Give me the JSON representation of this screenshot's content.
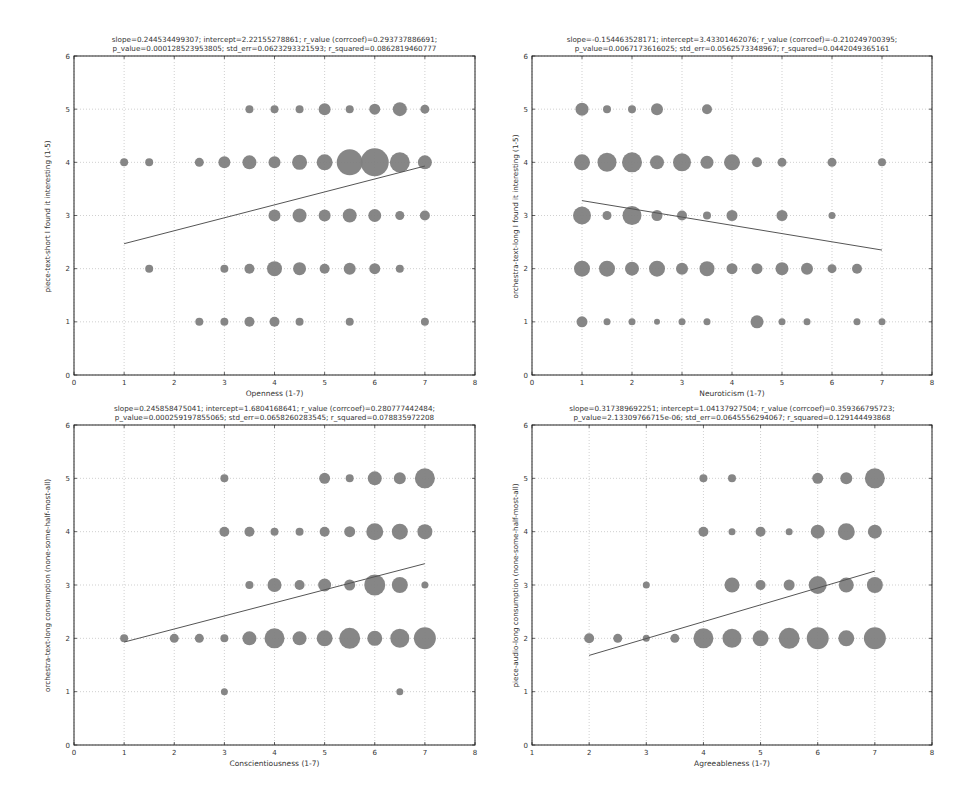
{
  "figure": {
    "background": "#ffffff",
    "marker_color": "#7f7f7f",
    "line_color": "#555555",
    "grid_color": "#b0b0b0"
  },
  "chart_data": [
    {
      "type": "scatter",
      "title_line1": "slope=0.244534499307; intercept=2.22155278861; r_value (corrcoef)=0.293737886691;",
      "title_line2": "p_value=0.000128523953805; std_err=0.0623293321593; r_squared=0.0862819460777",
      "xlabel": "Openness (1-7)",
      "ylabel": "piece-text-short I found it interesting (1-5)",
      "xlim": [
        0,
        8
      ],
      "ylim": [
        0,
        6
      ],
      "xticks": [
        0,
        1,
        2,
        3,
        4,
        5,
        6,
        7,
        8
      ],
      "yticks": [
        0,
        1,
        2,
        3,
        4,
        5,
        6
      ],
      "grid": true,
      "fit_line": {
        "x": [
          1,
          7
        ],
        "y": [
          2.47,
          3.93
        ]
      },
      "points": [
        {
          "x": 3.5,
          "y": 5,
          "r": 4
        },
        {
          "x": 4,
          "y": 5,
          "r": 4
        },
        {
          "x": 4.5,
          "y": 5,
          "r": 4
        },
        {
          "x": 5,
          "y": 5,
          "r": 6
        },
        {
          "x": 5.5,
          "y": 5,
          "r": 4
        },
        {
          "x": 6,
          "y": 5,
          "r": 5.5
        },
        {
          "x": 6.5,
          "y": 5,
          "r": 7
        },
        {
          "x": 7,
          "y": 5,
          "r": 4.5
        },
        {
          "x": 1,
          "y": 4,
          "r": 4
        },
        {
          "x": 1.5,
          "y": 4,
          "r": 4
        },
        {
          "x": 2.5,
          "y": 4,
          "r": 4.5
        },
        {
          "x": 3,
          "y": 4,
          "r": 6
        },
        {
          "x": 3.5,
          "y": 4,
          "r": 7
        },
        {
          "x": 4,
          "y": 4,
          "r": 6
        },
        {
          "x": 4.5,
          "y": 4,
          "r": 7.5
        },
        {
          "x": 5,
          "y": 4,
          "r": 8
        },
        {
          "x": 5.5,
          "y": 4,
          "r": 13
        },
        {
          "x": 6,
          "y": 4,
          "r": 14
        },
        {
          "x": 6.5,
          "y": 4,
          "r": 10
        },
        {
          "x": 7,
          "y": 4,
          "r": 7
        },
        {
          "x": 4,
          "y": 3,
          "r": 6
        },
        {
          "x": 4.5,
          "y": 3,
          "r": 7
        },
        {
          "x": 5,
          "y": 3,
          "r": 6
        },
        {
          "x": 5.5,
          "y": 3,
          "r": 7
        },
        {
          "x": 6,
          "y": 3,
          "r": 6.5
        },
        {
          "x": 6.5,
          "y": 3,
          "r": 4.5
        },
        {
          "x": 7,
          "y": 3,
          "r": 5
        },
        {
          "x": 1.5,
          "y": 2,
          "r": 4
        },
        {
          "x": 3,
          "y": 2,
          "r": 4
        },
        {
          "x": 3.5,
          "y": 2,
          "r": 5
        },
        {
          "x": 4,
          "y": 2,
          "r": 7.5
        },
        {
          "x": 4.5,
          "y": 2,
          "r": 6.5
        },
        {
          "x": 5,
          "y": 2,
          "r": 5
        },
        {
          "x": 5.5,
          "y": 2,
          "r": 6
        },
        {
          "x": 6,
          "y": 2,
          "r": 5.5
        },
        {
          "x": 6.5,
          "y": 2,
          "r": 4
        },
        {
          "x": 2.5,
          "y": 1,
          "r": 4
        },
        {
          "x": 3,
          "y": 1,
          "r": 4
        },
        {
          "x": 3.5,
          "y": 1,
          "r": 5
        },
        {
          "x": 4,
          "y": 1,
          "r": 5
        },
        {
          "x": 4.5,
          "y": 1,
          "r": 4
        },
        {
          "x": 5.5,
          "y": 1,
          "r": 4
        },
        {
          "x": 7,
          "y": 1,
          "r": 4
        }
      ]
    },
    {
      "type": "scatter",
      "title_line1": "slope=-0.154463528171; intercept=3.43301462076; r_value (corrcoef)=-0.210249700395;",
      "title_line2": "p_value=0.0067173616025; std_err=0.0562573348967; r_squared=0.0442049365161",
      "xlabel": "Neuroticism (1-7)",
      "ylabel": "orchestra-text-long I found it interesting (1-5)",
      "xlim": [
        0,
        8
      ],
      "ylim": [
        0,
        6
      ],
      "xticks": [
        0,
        1,
        2,
        3,
        4,
        5,
        6,
        7,
        8
      ],
      "yticks": [
        0,
        1,
        2,
        3,
        4,
        5,
        6
      ],
      "grid": true,
      "fit_line": {
        "x": [
          1,
          7
        ],
        "y": [
          3.28,
          2.35
        ]
      },
      "points": [
        {
          "x": 1,
          "y": 5,
          "r": 6.5
        },
        {
          "x": 1.5,
          "y": 5,
          "r": 4
        },
        {
          "x": 2,
          "y": 5,
          "r": 4
        },
        {
          "x": 2.5,
          "y": 5,
          "r": 6
        },
        {
          "x": 3.5,
          "y": 5,
          "r": 5
        },
        {
          "x": 1,
          "y": 4,
          "r": 8
        },
        {
          "x": 1.5,
          "y": 4,
          "r": 9.5
        },
        {
          "x": 2,
          "y": 4,
          "r": 10
        },
        {
          "x": 2.5,
          "y": 4,
          "r": 7
        },
        {
          "x": 3,
          "y": 4,
          "r": 9
        },
        {
          "x": 3.5,
          "y": 4,
          "r": 6.5
        },
        {
          "x": 4,
          "y": 4,
          "r": 8
        },
        {
          "x": 4.5,
          "y": 4,
          "r": 5
        },
        {
          "x": 5,
          "y": 4,
          "r": 4.5
        },
        {
          "x": 6,
          "y": 4,
          "r": 4.5
        },
        {
          "x": 7,
          "y": 4,
          "r": 4
        },
        {
          "x": 1,
          "y": 3,
          "r": 9
        },
        {
          "x": 1.5,
          "y": 3,
          "r": 4.5
        },
        {
          "x": 2,
          "y": 3,
          "r": 9.5
        },
        {
          "x": 2.5,
          "y": 3,
          "r": 5.5
        },
        {
          "x": 3,
          "y": 3,
          "r": 5
        },
        {
          "x": 3.5,
          "y": 3,
          "r": 4
        },
        {
          "x": 4,
          "y": 3,
          "r": 5.5
        },
        {
          "x": 5,
          "y": 3,
          "r": 5.5
        },
        {
          "x": 6,
          "y": 3,
          "r": 3.5
        },
        {
          "x": 1,
          "y": 2,
          "r": 8
        },
        {
          "x": 1.5,
          "y": 2,
          "r": 8
        },
        {
          "x": 2,
          "y": 2,
          "r": 7
        },
        {
          "x": 2.5,
          "y": 2,
          "r": 8
        },
        {
          "x": 3,
          "y": 2,
          "r": 6
        },
        {
          "x": 3.5,
          "y": 2,
          "r": 7.5
        },
        {
          "x": 4,
          "y": 2,
          "r": 5.5
        },
        {
          "x": 4.5,
          "y": 2,
          "r": 5.5
        },
        {
          "x": 5,
          "y": 2,
          "r": 6.5
        },
        {
          "x": 5.5,
          "y": 2,
          "r": 6
        },
        {
          "x": 6,
          "y": 2,
          "r": 4.5
        },
        {
          "x": 6.5,
          "y": 2,
          "r": 5
        },
        {
          "x": 1,
          "y": 1,
          "r": 5.5
        },
        {
          "x": 1.5,
          "y": 1,
          "r": 3.5
        },
        {
          "x": 2,
          "y": 1,
          "r": 3.5
        },
        {
          "x": 2.5,
          "y": 1,
          "r": 3
        },
        {
          "x": 3,
          "y": 1,
          "r": 3.5
        },
        {
          "x": 3.5,
          "y": 1,
          "r": 3.5
        },
        {
          "x": 4.5,
          "y": 1,
          "r": 6.5
        },
        {
          "x": 5,
          "y": 1,
          "r": 3.5
        },
        {
          "x": 5.5,
          "y": 1,
          "r": 3.5
        },
        {
          "x": 6.5,
          "y": 1,
          "r": 3.5
        },
        {
          "x": 7,
          "y": 1,
          "r": 3.5
        }
      ]
    },
    {
      "type": "scatter",
      "title_line1": "slope=0.245858475041; intercept=1.6804168641; r_value (corrcoef)=0.280777442484;",
      "title_line2": "p_value=0.000259197855065; std_err=0.0658260283545; r_squared=0.078835972208",
      "xlabel": "Conscientiousness (1-7)",
      "ylabel": "orchestra-text-long consumption (none-some-half-most-all)",
      "xlim": [
        0,
        8
      ],
      "ylim": [
        0,
        6
      ],
      "xticks": [
        0,
        1,
        2,
        3,
        4,
        5,
        6,
        7,
        8
      ],
      "yticks": [
        0,
        1,
        2,
        3,
        4,
        5,
        6
      ],
      "grid": true,
      "fit_line": {
        "x": [
          1,
          7
        ],
        "y": [
          1.93,
          3.4
        ]
      },
      "points": [
        {
          "x": 3,
          "y": 5,
          "r": 4
        },
        {
          "x": 5,
          "y": 5,
          "r": 5.5
        },
        {
          "x": 5.5,
          "y": 5,
          "r": 4
        },
        {
          "x": 6,
          "y": 5,
          "r": 7
        },
        {
          "x": 6.5,
          "y": 5,
          "r": 6
        },
        {
          "x": 7,
          "y": 5,
          "r": 10
        },
        {
          "x": 3,
          "y": 4,
          "r": 5
        },
        {
          "x": 3.5,
          "y": 4,
          "r": 5
        },
        {
          "x": 4,
          "y": 4,
          "r": 4
        },
        {
          "x": 4.5,
          "y": 4,
          "r": 4
        },
        {
          "x": 5,
          "y": 4,
          "r": 5
        },
        {
          "x": 5.5,
          "y": 4,
          "r": 5.5
        },
        {
          "x": 6,
          "y": 4,
          "r": 8.5
        },
        {
          "x": 6.5,
          "y": 4,
          "r": 8
        },
        {
          "x": 7,
          "y": 4,
          "r": 7.5
        },
        {
          "x": 3.5,
          "y": 3,
          "r": 4
        },
        {
          "x": 4,
          "y": 3,
          "r": 7
        },
        {
          "x": 4.5,
          "y": 3,
          "r": 5
        },
        {
          "x": 5,
          "y": 3,
          "r": 6.5
        },
        {
          "x": 5.5,
          "y": 3,
          "r": 5.5
        },
        {
          "x": 6,
          "y": 3,
          "r": 10.5
        },
        {
          "x": 6.5,
          "y": 3,
          "r": 8
        },
        {
          "x": 7,
          "y": 3,
          "r": 3.5
        },
        {
          "x": 1,
          "y": 2,
          "r": 4
        },
        {
          "x": 2,
          "y": 2,
          "r": 4.5
        },
        {
          "x": 2.5,
          "y": 2,
          "r": 4.5
        },
        {
          "x": 3,
          "y": 2,
          "r": 4
        },
        {
          "x": 3.5,
          "y": 2,
          "r": 7
        },
        {
          "x": 4,
          "y": 2,
          "r": 10
        },
        {
          "x": 4.5,
          "y": 2,
          "r": 7
        },
        {
          "x": 5,
          "y": 2,
          "r": 8
        },
        {
          "x": 5.5,
          "y": 2,
          "r": 10.5
        },
        {
          "x": 6,
          "y": 2,
          "r": 7.5
        },
        {
          "x": 6.5,
          "y": 2,
          "r": 9.5
        },
        {
          "x": 7,
          "y": 2,
          "r": 11
        },
        {
          "x": 3,
          "y": 1,
          "r": 3.5
        },
        {
          "x": 6.5,
          "y": 1,
          "r": 3.5
        }
      ]
    },
    {
      "type": "scatter",
      "title_line1": "slope=0.317389692251; intercept=1.04137927504; r_value (corrcoef)=0.359366795723;",
      "title_line2": "p_value=2.13309766715e-06; std_err=0.0645556294067; r_squared=0.129144493868",
      "xlabel": "Agreeableness (1-7)",
      "ylabel": "piece-audio-long consumption (none-some-half-most-all)",
      "xlim": [
        1,
        8
      ],
      "ylim": [
        0,
        6
      ],
      "xticks": [
        1,
        2,
        3,
        4,
        5,
        6,
        7,
        8
      ],
      "yticks": [
        0,
        1,
        2,
        3,
        4,
        5,
        6
      ],
      "grid": true,
      "fit_line": {
        "x": [
          2,
          7
        ],
        "y": [
          1.68,
          3.26
        ]
      },
      "points": [
        {
          "x": 4,
          "y": 5,
          "r": 4
        },
        {
          "x": 4.5,
          "y": 5,
          "r": 4
        },
        {
          "x": 6,
          "y": 5,
          "r": 5.5
        },
        {
          "x": 6.5,
          "y": 5,
          "r": 6
        },
        {
          "x": 7,
          "y": 5,
          "r": 10
        },
        {
          "x": 4,
          "y": 4,
          "r": 5
        },
        {
          "x": 4.5,
          "y": 4,
          "r": 3.5
        },
        {
          "x": 5,
          "y": 4,
          "r": 5
        },
        {
          "x": 5.5,
          "y": 4,
          "r": 3.5
        },
        {
          "x": 6,
          "y": 4,
          "r": 7
        },
        {
          "x": 6.5,
          "y": 4,
          "r": 8.5
        },
        {
          "x": 7,
          "y": 4,
          "r": 7
        },
        {
          "x": 3,
          "y": 3,
          "r": 3.5
        },
        {
          "x": 4.5,
          "y": 3,
          "r": 7.5
        },
        {
          "x": 5,
          "y": 3,
          "r": 5
        },
        {
          "x": 5.5,
          "y": 3,
          "r": 5.5
        },
        {
          "x": 6,
          "y": 3,
          "r": 9
        },
        {
          "x": 6.5,
          "y": 3,
          "r": 7.5
        },
        {
          "x": 7,
          "y": 3,
          "r": 8
        },
        {
          "x": 2,
          "y": 2,
          "r": 5
        },
        {
          "x": 2.5,
          "y": 2,
          "r": 4.5
        },
        {
          "x": 3,
          "y": 2,
          "r": 3.5
        },
        {
          "x": 3.5,
          "y": 2,
          "r": 4.5
        },
        {
          "x": 4,
          "y": 2,
          "r": 10
        },
        {
          "x": 4.5,
          "y": 2,
          "r": 9.5
        },
        {
          "x": 5,
          "y": 2,
          "r": 8
        },
        {
          "x": 5.5,
          "y": 2,
          "r": 10.5
        },
        {
          "x": 6,
          "y": 2,
          "r": 11
        },
        {
          "x": 6.5,
          "y": 2,
          "r": 8
        },
        {
          "x": 7,
          "y": 2,
          "r": 11
        }
      ]
    }
  ]
}
